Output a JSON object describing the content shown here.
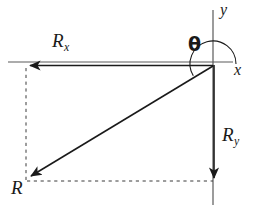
{
  "figure": {
    "background_color": "#ffffff",
    "stroke_color": "#1a1a1a",
    "axis_color": "#555555",
    "width": 255,
    "height": 214
  },
  "labels": {
    "rx": {
      "base": "R",
      "sub": "x"
    },
    "ry": {
      "base": "R",
      "sub": "y"
    },
    "r": {
      "base": "R",
      "sub": ""
    },
    "x_axis": "x",
    "y_axis": "y",
    "theta": "θ"
  },
  "geometry": {
    "origin": {
      "x": 213,
      "y": 64
    },
    "x_axis_line": {
      "x1": 8,
      "y1": 62,
      "x2": 233,
      "y2": 62
    },
    "y_axis_line": {
      "x1": 213,
      "y1": 10,
      "x2": 213,
      "y2": 205
    },
    "rx_vector": {
      "x1": 213,
      "y1": 65,
      "x2": 27,
      "y2": 65,
      "arrow_at": "end"
    },
    "ry_vector": {
      "x1": 214,
      "y1": 65,
      "x2": 214,
      "y2": 181,
      "arrow_at": "end"
    },
    "r_vector": {
      "x1": 213,
      "y1": 66,
      "x2": 28,
      "y2": 178,
      "arrow_at": "end"
    },
    "dashed_vertical": {
      "x1": 26,
      "y1": 68,
      "x2": 26,
      "y2": 181
    },
    "dashed_horizontal": {
      "x1": 27,
      "y1": 181,
      "x2": 213,
      "y2": 181
    },
    "theta_arc": {
      "center": {
        "x": 213,
        "y": 64
      },
      "radius": 23,
      "start_angle_deg": 0,
      "end_angle_deg": 211,
      "direction": "counterclockwise"
    }
  }
}
